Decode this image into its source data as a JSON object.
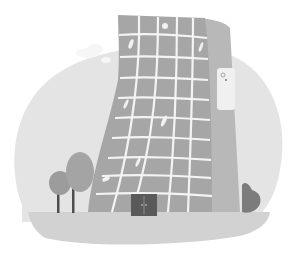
{
  "illustration": {
    "subject": "curved-skyscraper",
    "palette": {
      "background": "#ffffff",
      "sky": "#e4e4e4",
      "cloud": "#f6f6f6",
      "ground": "#d2d2d2",
      "building": "#a6a6a6",
      "building_side": "#b8b8b8",
      "window": "#9a9a9a",
      "grid_line": "#f4f4f4",
      "door": "#5a5a5a",
      "tree_light": "#9c9c9c",
      "tree_dark": "#7c7c7c",
      "trunk": "#4e4e4e",
      "sign": "#f0f0f0"
    },
    "elements": [
      "sky-circle",
      "cloud",
      "building",
      "window-grid",
      "entrance-door",
      "sign-panel",
      "tree-left",
      "tree-right",
      "bush",
      "ground"
    ]
  }
}
